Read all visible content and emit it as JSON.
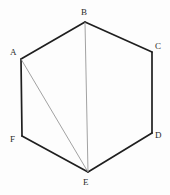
{
  "figure": {
    "name": "hexagon-with-diagonals",
    "canvas": {
      "width": 170,
      "height": 195
    },
    "background_color": "#fdfdfd",
    "outline_color": "#1f1f1f",
    "diagonal_color": "#8a8a8a",
    "label_color": "#2b2b2b",
    "outline_width": 1.7,
    "diagonal_width": 0.8,
    "vertices": [
      {
        "id": "A",
        "label": "A",
        "x": 21,
        "y": 59,
        "label_x": 10,
        "label_y": 48
      },
      {
        "id": "B",
        "label": "B",
        "x": 85,
        "y": 22,
        "label_x": 81,
        "label_y": 8
      },
      {
        "id": "C",
        "label": "C",
        "x": 152,
        "y": 52,
        "label_x": 155,
        "label_y": 42
      },
      {
        "id": "D",
        "label": "D",
        "x": 152,
        "y": 133,
        "label_x": 155,
        "label_y": 131
      },
      {
        "id": "E",
        "label": "E",
        "x": 88,
        "y": 172,
        "label_x": 83,
        "label_y": 178
      },
      {
        "id": "F",
        "label": "F",
        "x": 22,
        "y": 136,
        "label_x": 10,
        "label_y": 135
      }
    ],
    "outline_edges": [
      {
        "from": "A",
        "to": "B"
      },
      {
        "from": "B",
        "to": "C"
      },
      {
        "from": "C",
        "to": "D"
      },
      {
        "from": "D",
        "to": "E"
      },
      {
        "from": "E",
        "to": "F"
      },
      {
        "from": "F",
        "to": "A"
      }
    ],
    "diagonals": [
      {
        "from": "A",
        "to": "E"
      },
      {
        "from": "B",
        "to": "E"
      }
    ]
  }
}
